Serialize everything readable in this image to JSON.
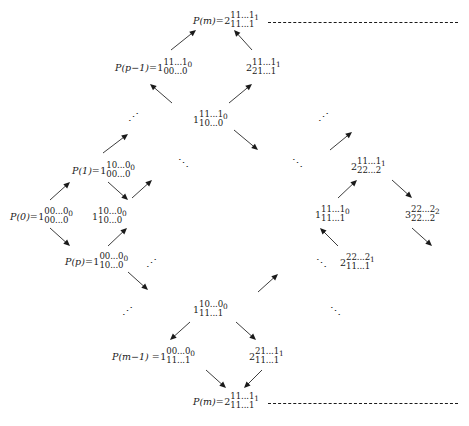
{
  "figure": {
    "type": "hasse-lattice-diagram"
  },
  "nodes": [
    {
      "id": "top-pm",
      "label": "P(m)=",
      "base": "2",
      "top": "11...1",
      "bottom": "11...1",
      "sub": "1",
      "x": 193,
      "y": 11
    },
    {
      "id": "p-p-1",
      "label": "P(p−1)=",
      "base": "1",
      "top": "11...1",
      "bottom": "00...0",
      "sub": "0",
      "x": 115,
      "y": 58
    },
    {
      "id": "n-2-11-21",
      "label": "",
      "base": "2",
      "top": "11...1",
      "bottom": "21...1",
      "sub": "1",
      "x": 246,
      "y": 58
    },
    {
      "id": "n-1-11-10",
      "label": "",
      "base": "1",
      "top": "11...1",
      "bottom": "10...0",
      "sub": "0",
      "x": 193,
      "y": 110
    },
    {
      "id": "p-1",
      "label": "P(1)=",
      "base": "1",
      "top": "10...0",
      "bottom": "00...0",
      "sub": "0",
      "x": 72,
      "y": 161
    },
    {
      "id": "n-2-11-22",
      "label": "",
      "base": "2",
      "top": "11...1",
      "bottom": "22...2",
      "sub": "1",
      "x": 351,
      "y": 157
    },
    {
      "id": "p-0",
      "label": "P(0)=",
      "base": "1",
      "top": "00...0",
      "bottom": "00...0",
      "sub": "0",
      "x": 10,
      "y": 207
    },
    {
      "id": "n-1-10-10",
      "label": "",
      "base": "1",
      "top": "10...0",
      "bottom": "10...0",
      "sub": "0",
      "x": 92,
      "y": 207
    },
    {
      "id": "n-1-11-11",
      "label": "",
      "base": "1",
      "top": "11...1",
      "bottom": "11...1",
      "sub": "0",
      "x": 315,
      "y": 205
    },
    {
      "id": "n-3-22-22",
      "label": "",
      "base": "3",
      "top": "22...2",
      "bottom": "22...2",
      "sub": "2",
      "x": 405,
      "y": 205
    },
    {
      "id": "p-p",
      "label": "P(p)=",
      "base": "1",
      "top": "00...0",
      "bottom": "10...0",
      "sub": "0",
      "x": 65,
      "y": 252
    },
    {
      "id": "n-2-22-11",
      "label": "",
      "base": "2",
      "top": "22...2",
      "bottom": "11...1",
      "sub": "1",
      "x": 340,
      "y": 253
    },
    {
      "id": "n-1-10-11",
      "label": "",
      "base": "1",
      "top": "10...0",
      "bottom": "11...1",
      "sub": "0",
      "x": 193,
      "y": 300
    },
    {
      "id": "p-m-1",
      "label": "P(m−1) =",
      "base": "1",
      "top": "00...0",
      "bottom": "11...1",
      "sub": "0",
      "x": 112,
      "y": 347
    },
    {
      "id": "n-2-21-11",
      "label": "",
      "base": "2",
      "top": "21...1",
      "bottom": "11...1",
      "sub": "1",
      "x": 249,
      "y": 347
    },
    {
      "id": "bot-pm",
      "label": "P(m)=",
      "base": "2",
      "top": "11...1",
      "bottom": "11...1",
      "sub": "1",
      "x": 193,
      "y": 392
    }
  ],
  "edges": [
    {
      "from": "p-p-1",
      "to": "top-pm",
      "x1": 171,
      "y1": 50,
      "x2": 196,
      "y2": 30
    },
    {
      "from": "n-2-11-21",
      "to": "top-pm",
      "x1": 252,
      "y1": 50,
      "x2": 234,
      "y2": 30
    },
    {
      "from": "n-1-11-10",
      "to": "p-p-1",
      "x1": 172,
      "y1": 103,
      "x2": 150,
      "y2": 84
    },
    {
      "from": "n-1-11-10",
      "to": "n-2-11-21",
      "x1": 229,
      "y1": 103,
      "x2": 252,
      "y2": 84
    },
    {
      "from": "p-1",
      "to": "dots-upleft",
      "x1": 103,
      "y1": 153,
      "x2": 128,
      "y2": 134
    },
    {
      "from": "n-1-11-10",
      "to": "dots-downright",
      "x1": 234,
      "y1": 130,
      "x2": 258,
      "y2": 150
    },
    {
      "from": "dots-upright",
      "to": "n-2-11-22",
      "x1": 330,
      "y1": 150,
      "x2": 352,
      "y2": 132
    },
    {
      "from": "p-0",
      "to": "p-1",
      "x1": 50,
      "y1": 200,
      "x2": 70,
      "y2": 182
    },
    {
      "from": "n-1-10-10",
      "to": "dots-mid",
      "x1": 132,
      "y1": 198,
      "x2": 152,
      "y2": 180
    },
    {
      "from": "p-1",
      "to": "n-1-10-10",
      "x1": 108,
      "y1": 182,
      "x2": 128,
      "y2": 200
    },
    {
      "from": "p-0",
      "to": "p-p",
      "x1": 50,
      "y1": 228,
      "x2": 70,
      "y2": 246
    },
    {
      "from": "p-p",
      "to": "n-1-10-10",
      "x1": 108,
      "y1": 246,
      "x2": 127,
      "y2": 228
    },
    {
      "from": "n-1-11-11",
      "to": "n-2-11-22",
      "x1": 338,
      "y1": 198,
      "x2": 357,
      "y2": 180
    },
    {
      "from": "n-2-11-22",
      "to": "n-3-22-22",
      "x1": 392,
      "y1": 180,
      "x2": 412,
      "y2": 198
    },
    {
      "from": "n-2-22-11",
      "to": "n-1-11-11",
      "x1": 338,
      "y1": 246,
      "x2": 320,
      "y2": 228
    },
    {
      "from": "n-3-22-22",
      "to": "down-right",
      "x1": 412,
      "y1": 228,
      "x2": 432,
      "y2": 246
    },
    {
      "from": "p-p",
      "to": "dots-low",
      "x1": 128,
      "y1": 272,
      "x2": 148,
      "y2": 290
    },
    {
      "from": "n-1-10-11",
      "to": "n-2-22-11",
      "x1": 258,
      "y1": 292,
      "x2": 278,
      "y2": 274
    },
    {
      "from": "n-1-10-11",
      "to": "p-m-1",
      "x1": 190,
      "y1": 322,
      "x2": 170,
      "y2": 340
    },
    {
      "from": "n-1-10-11",
      "to": "n-2-21-11",
      "x1": 236,
      "y1": 322,
      "x2": 256,
      "y2": 340
    },
    {
      "from": "p-m-1",
      "to": "bot-pm",
      "x1": 206,
      "y1": 370,
      "x2": 226,
      "y2": 388
    },
    {
      "from": "n-2-21-11",
      "to": "bot-pm",
      "x1": 262,
      "y1": 370,
      "x2": 244,
      "y2": 388
    }
  ],
  "ellipses": [
    {
      "id": "e1",
      "kind": "up-right",
      "x": 128,
      "y": 112
    },
    {
      "id": "e2",
      "kind": "up-right",
      "x": 318,
      "y": 112
    },
    {
      "id": "e3",
      "kind": "down-right",
      "x": 178,
      "y": 158
    },
    {
      "id": "e4",
      "kind": "down-right",
      "x": 292,
      "y": 158
    },
    {
      "id": "e5",
      "kind": "up-right",
      "x": 146,
      "y": 258
    },
    {
      "id": "e6",
      "kind": "down-right",
      "x": 316,
      "y": 258
    },
    {
      "id": "e7",
      "kind": "up-right",
      "x": 122,
      "y": 306
    },
    {
      "id": "e8",
      "kind": "down-right",
      "x": 330,
      "y": 306
    }
  ],
  "dashed_rails": [
    {
      "id": "rail-top",
      "x": 268,
      "y": 22,
      "width": 190
    },
    {
      "id": "rail-bottom",
      "x": 268,
      "y": 403,
      "width": 190
    }
  ]
}
